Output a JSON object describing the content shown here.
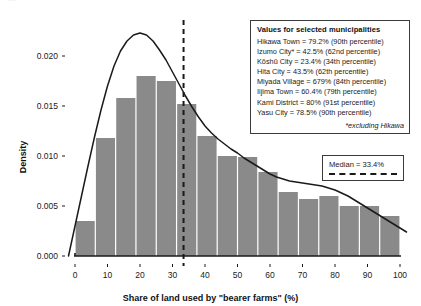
{
  "figure": {
    "top_fragment": "…"
  },
  "chart_data": {
    "type": "bar",
    "title": "",
    "xlabel": "Share of land used by \"bearer farms\" (%)",
    "ylabel": "Density",
    "xlim": [
      -3,
      103
    ],
    "ylim": [
      0.0,
      0.0225
    ],
    "grid": false,
    "bin_width": 6.25,
    "categories": [
      "0-6.25",
      "6.25-12.5",
      "12.5-18.75",
      "18.75-25",
      "25-31.25",
      "31.25-37.5",
      "37.5-43.75",
      "43.75-50",
      "50-56.25",
      "56.25-62.5",
      "62.5-68.75",
      "68.75-75",
      "75-81.25",
      "81.25-87.5",
      "87.5-93.75",
      "93.75-100"
    ],
    "bin_edges": [
      0,
      6.25,
      12.5,
      18.75,
      25,
      31.25,
      37.5,
      43.75,
      50,
      56.25,
      62.5,
      68.75,
      75,
      81.25,
      87.5,
      93.75,
      100
    ],
    "values": [
      0.0035,
      0.0118,
      0.0158,
      0.018,
      0.0175,
      0.0152,
      0.012,
      0.01,
      0.0099,
      0.0084,
      0.0064,
      0.0057,
      0.006,
      0.005,
      0.005,
      0.004
    ],
    "xticks": [
      0,
      10,
      20,
      30,
      40,
      50,
      60,
      70,
      80,
      90,
      100
    ],
    "xtick_labels": [
      "0",
      "10",
      "20",
      "30",
      "40",
      "50",
      "60",
      "70",
      "80",
      "90",
      "100"
    ],
    "yticks": [
      0.0,
      0.005,
      0.01,
      0.015,
      0.02
    ],
    "ytick_labels": [
      "0.000",
      "0.005",
      "0.010",
      "0.015",
      "0.020"
    ],
    "series": [
      {
        "name": "histogram",
        "kind": "bar",
        "color": "#8a8a8a",
        "values": [
          0.0035,
          0.0118,
          0.0158,
          0.018,
          0.0175,
          0.0152,
          0.012,
          0.01,
          0.0099,
          0.0084,
          0.0064,
          0.0057,
          0.006,
          0.005,
          0.005,
          0.004
        ]
      },
      {
        "name": "density-curve",
        "kind": "line",
        "color": "#1a1a1a",
        "x": [
          -2,
          0,
          2,
          4,
          6,
          8,
          10,
          12,
          14,
          16,
          18,
          20,
          22,
          24,
          26,
          28,
          30,
          32,
          34,
          36,
          38,
          40,
          42,
          44,
          46,
          48,
          50,
          52,
          54,
          56,
          58,
          60,
          62,
          64,
          66,
          68,
          70,
          72,
          74,
          76,
          78,
          80,
          82,
          84,
          86,
          88,
          90,
          92,
          94,
          96,
          98,
          100,
          102
        ],
        "y": [
          0.0,
          0.003,
          0.006,
          0.009,
          0.0119,
          0.0146,
          0.017,
          0.019,
          0.0205,
          0.0215,
          0.0221,
          0.0223,
          0.0221,
          0.0215,
          0.0206,
          0.0196,
          0.0184,
          0.0172,
          0.016,
          0.0149,
          0.0139,
          0.013,
          0.0123,
          0.0117,
          0.0112,
          0.0107,
          0.0103,
          0.0098,
          0.0094,
          0.009,
          0.0086,
          0.0082,
          0.0079,
          0.0077,
          0.0075,
          0.0074,
          0.0073,
          0.0072,
          0.0071,
          0.007,
          0.0068,
          0.0066,
          0.0063,
          0.006,
          0.0056,
          0.0052,
          0.0048,
          0.0044,
          0.004,
          0.0036,
          0.0032,
          0.0028,
          0.0024
        ]
      }
    ],
    "annotations": {
      "median_line": {
        "value": 33.4,
        "style": "dashed",
        "color": "#1a1a1a"
      }
    }
  },
  "municipality_legend": {
    "title": "Values for selected municipalities",
    "rows": [
      "Hikawa Town = 79.2% (90th percentile)",
      "Izumo City* = 42.5% (62nd percentile)",
      "Kōshū City = 23.4% (34th percentile)",
      "Hita City = 43.5% (62th percentile)",
      "Miyada Village = 679% (84th percentile)",
      "Iijima Town = 60.4% (79th percentile)",
      "Kami District = 80% (91st percentile)",
      "Yasu City = 78.5% (90th percentile)"
    ],
    "note": "*excluding Hikawa"
  },
  "median_legend": {
    "label": "Median = 33.4%"
  }
}
